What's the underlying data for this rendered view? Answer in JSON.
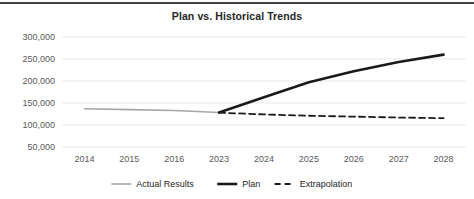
{
  "chart_data": {
    "type": "line",
    "title": "Plan vs. Historical Trends",
    "xlabel": "",
    "ylabel": "",
    "categories": [
      "2014",
      "2015",
      "2016",
      "2023",
      "2024",
      "2025",
      "2026",
      "2027",
      "2028"
    ],
    "ylim": [
      50000,
      300000
    ],
    "yticks": [
      "50,000",
      "100,000",
      "150,000",
      "200,000",
      "250,000",
      "300,000"
    ],
    "ytick_values": [
      50000,
      100000,
      150000,
      200000,
      250000,
      300000
    ],
    "grid": true,
    "legend_position": "bottom",
    "series": [
      {
        "name": "Actual Results",
        "color": "#a6a6a6",
        "style": "solid",
        "width": 1.6,
        "values": [
          137000,
          135000,
          133000,
          128500,
          null,
          null,
          null,
          null,
          null
        ]
      },
      {
        "name": "Plan",
        "color": "#1a1a1a",
        "style": "solid",
        "width": 2.6,
        "values": [
          null,
          null,
          null,
          128500,
          163000,
          197000,
          222000,
          243000,
          260000
        ]
      },
      {
        "name": "Extrapolation",
        "color": "#1a1a1a",
        "style": "dashed",
        "width": 1.8,
        "values": [
          null,
          null,
          null,
          128000,
          124000,
          121000,
          119000,
          117000,
          115500
        ]
      }
    ]
  },
  "legend": {
    "items": [
      {
        "label": "Actual Results"
      },
      {
        "label": "Plan"
      },
      {
        "label": "Extrapolation"
      }
    ]
  },
  "colors": {
    "rule": "#444444",
    "title": "#262626",
    "tick": "#595959",
    "grid": "#e8e8e8"
  }
}
